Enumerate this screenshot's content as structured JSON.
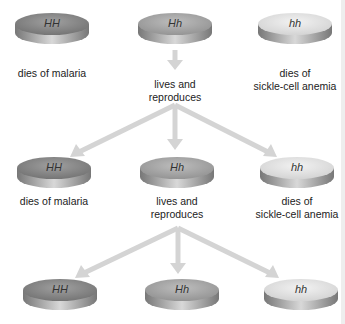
{
  "colors": {
    "HH_top": "#8a8a8a",
    "Hh_top": "#a6a6a6",
    "hh_top": "#dcdcdc",
    "arrow": "#d4d4d4"
  },
  "rows": [
    {
      "disks": [
        {
          "genotype": "HH",
          "caption": [
            "dies of malaria"
          ]
        },
        {
          "genotype": "Hh",
          "caption": [
            "lives and",
            "reproduces"
          ]
        },
        {
          "genotype": "hh",
          "caption": [
            "dies of",
            "sickle-cell anemia"
          ]
        }
      ]
    },
    {
      "disks": [
        {
          "genotype": "HH",
          "caption": [
            "dies of malaria"
          ]
        },
        {
          "genotype": "Hh",
          "caption": [
            "lives and",
            "reproduces"
          ]
        },
        {
          "genotype": "hh",
          "caption": [
            "dies of",
            "sickle-cell anemia"
          ]
        }
      ]
    },
    {
      "disks": [
        {
          "genotype": "HH"
        },
        {
          "genotype": "Hh"
        },
        {
          "genotype": "hh"
        }
      ]
    }
  ]
}
